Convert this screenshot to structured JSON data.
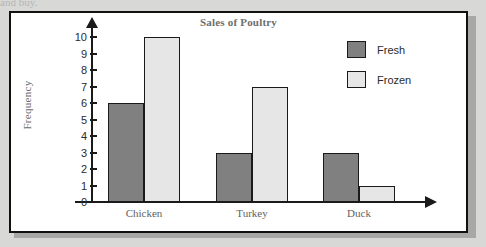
{
  "page": {
    "clipped_top_text": "and buy.",
    "background_color": "#d8d8d6",
    "panel_background": "#ffffff",
    "panel_border_color": "#111111"
  },
  "chart_data": {
    "type": "bar",
    "title": "Sales of Poultry",
    "xlabel": "",
    "ylabel": "Frequency",
    "categories": [
      "Chicken",
      "Turkey",
      "Duck"
    ],
    "series": [
      {
        "name": "Fresh",
        "color": "#808080",
        "values": [
          6,
          3,
          3
        ]
      },
      {
        "name": "Frozen",
        "color": "#e6e6e6",
        "values": [
          10,
          7,
          1
        ]
      }
    ],
    "ylim": [
      0,
      10
    ],
    "ytick_labels": [
      "10",
      "9",
      "8",
      "7",
      "6",
      "5",
      "4",
      "3",
      "2",
      "1",
      "0"
    ],
    "grid": false,
    "legend_position": "top-right",
    "axis_arrows": true
  },
  "legend": {
    "items": [
      {
        "label": "Fresh",
        "color": "#808080"
      },
      {
        "label": "Frozen",
        "color": "#e6e6e6"
      }
    ]
  }
}
